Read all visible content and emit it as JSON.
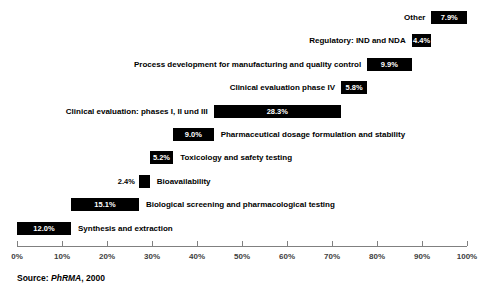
{
  "chart_data": {
    "type": "bar",
    "title": "",
    "subtitle": "",
    "xlabel": "",
    "ylabel": "",
    "xlim": [
      0,
      100
    ],
    "grid": false,
    "legend": null,
    "orientation": "horizontal",
    "style": "cascade-waterfall",
    "axis": {
      "tick_labels": [
        "0%",
        "10%",
        "20%",
        "30%",
        "40%",
        "50%",
        "60%",
        "70%",
        "80%",
        "90%",
        "100%"
      ],
      "tick_values": [
        0,
        10,
        20,
        30,
        40,
        50,
        60,
        70,
        80,
        90,
        100
      ]
    },
    "categories": [
      "Other",
      "Regulatory: IND and NDA",
      "Process development for manufacturing and quality control",
      "Clinical evaluation phase IV",
      "Clinical evaluation: phases I, II und III",
      "Pharmaceutical dosage formulation and stability",
      "Toxicology and safety testing",
      "Bioavailability",
      "Biological screening and pharmacological testing",
      "Synthesis and extraction"
    ],
    "values": [
      7.9,
      4.4,
      9.9,
      5.8,
      28.3,
      9.0,
      5.2,
      2.4,
      15.1,
      12.0
    ],
    "value_labels": [
      "7.9%",
      "4.4%",
      "9.9%",
      "5.8%",
      "28.3%",
      "9.0%",
      "5.2%",
      "2.4%",
      "15.1%",
      "12.0%"
    ],
    "cumulative_starts": [
      92.1,
      87.7,
      77.8,
      72.0,
      43.7,
      34.7,
      29.5,
      27.1,
      12.0,
      0.0
    ],
    "bar_color": "#000000",
    "value_text_color": "#ffffff",
    "label_text_color": "#000000"
  },
  "bars": [
    {
      "label": "Other",
      "value_label": "7.9%",
      "label_side": "left",
      "value_inside": true
    },
    {
      "label": "Regulatory: IND and NDA",
      "value_label": "4.4%",
      "label_side": "left",
      "value_inside": true
    },
    {
      "label": "Process development for manufacturing and quality control",
      "value_label": "9.9%",
      "label_side": "left",
      "value_inside": true
    },
    {
      "label": "Clinical evaluation phase IV",
      "value_label": "5.8%",
      "label_side": "left",
      "value_inside": true
    },
    {
      "label": "Clinical evaluation: phases I, II und III",
      "value_label": "28.3%",
      "label_side": "left",
      "value_inside": true
    },
    {
      "label": "Pharmaceutical dosage formulation and stability",
      "value_label": "9.0%",
      "label_side": "right",
      "value_inside": true
    },
    {
      "label": "Toxicology and safety testing",
      "value_label": "5.2%",
      "label_side": "right",
      "value_inside": true
    },
    {
      "label": "Bioavailability",
      "value_label": "2.4%",
      "label_side": "right",
      "value_inside": false
    },
    {
      "label": "Biological screening and pharmacological testing",
      "value_label": "15.1%",
      "label_side": "right",
      "value_inside": true
    },
    {
      "label": "Synthesis and extraction",
      "value_label": "12.0%",
      "label_side": "right",
      "value_inside": true
    }
  ],
  "source": {
    "prefix": "Source: ",
    "emphasis": "PhRMA",
    "suffix": ", 2000"
  }
}
